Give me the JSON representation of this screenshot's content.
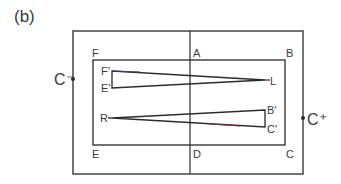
{
  "figure": {
    "panel_label": "(b)"
  },
  "labels": {
    "c_minus": "C⁻",
    "c_plus": "C⁺",
    "A": "A",
    "B": "B",
    "C": "C",
    "D": "D",
    "E": "E",
    "F": "F",
    "F_prime": "F′",
    "E_prime": "E′",
    "L": "L",
    "R": "R",
    "B_prime": "B′",
    "C_prime": "C′"
  },
  "colors": {
    "line": "#2a2a2a",
    "text": "#3a3a3a",
    "accent_wire": "#8a2a3a"
  }
}
